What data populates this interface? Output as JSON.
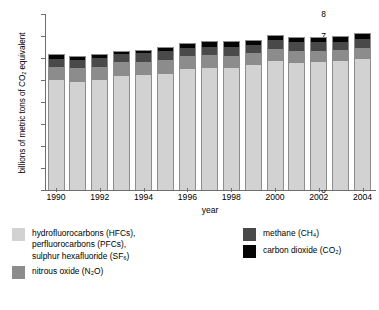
{
  "chart_data": {
    "type": "bar",
    "subtype": "stacked-bar",
    "title": "",
    "xlabel": "year",
    "ylabel": "billions of metric tons of CO2 equivalent",
    "ylabel_display": "billions of metric tons of CO₂ equivalent",
    "ylim": [
      0,
      8
    ],
    "ytick_values": [
      0,
      1,
      2,
      3,
      4,
      5,
      6,
      7,
      8
    ],
    "ytick_labels": [
      "0",
      "1",
      "2",
      "3",
      "4",
      "5",
      "6",
      "7",
      "8"
    ],
    "grid": false,
    "legend_position": "below-plot",
    "categories": [
      1990,
      1991,
      1992,
      1993,
      1994,
      1995,
      1996,
      1997,
      1998,
      1999,
      2000,
      2001,
      2002,
      2003,
      2004
    ],
    "xtick_labels": [
      "1990",
      "1992",
      "1994",
      "1996",
      "1998",
      "2000",
      "2002",
      "2004"
    ],
    "xtick_categories": [
      1990,
      1992,
      1994,
      1996,
      1998,
      2000,
      2002,
      2004
    ],
    "series": [
      {
        "name": "carbon dioxide (CO2)",
        "color": "#050505",
        "values": [
          5.02,
          4.96,
          5.05,
          5.24,
          5.27,
          5.33,
          5.53,
          5.58,
          5.57,
          5.71,
          5.89,
          5.83,
          5.85,
          5.88,
          5.97
        ]
      },
      {
        "name": "methane (CH4)",
        "color": "#494949",
        "values": [
          0.62,
          0.62,
          0.6,
          0.6,
          0.6,
          0.6,
          0.59,
          0.58,
          0.57,
          0.55,
          0.55,
          0.54,
          0.53,
          0.52,
          0.52
        ]
      },
      {
        "name": "nitrous oxide (N2O)",
        "color": "#8c8c8c",
        "values": [
          0.38,
          0.38,
          0.39,
          0.38,
          0.41,
          0.42,
          0.4,
          0.4,
          0.4,
          0.39,
          0.4,
          0.39,
          0.39,
          0.39,
          0.4
        ]
      },
      {
        "name": "hydrofluorocarbons (HFCs), perfluorocarbons (PFCs), sulphur hexafluoride (SF6)",
        "color": "#d2d2d2",
        "values": [
          0.14,
          0.12,
          0.15,
          0.08,
          0.1,
          0.16,
          0.16,
          0.2,
          0.25,
          0.16,
          0.2,
          0.19,
          0.19,
          0.22,
          0.24
        ]
      }
    ],
    "totals": [
      6.16,
      6.08,
      6.19,
      6.3,
      6.38,
      6.51,
      6.68,
      6.76,
      6.79,
      6.81,
      7.04,
      6.95,
      6.96,
      7.01,
      7.13
    ]
  },
  "axes": {
    "y_title": "billions of metric tons of CO₂ equivalent",
    "x_title": "year",
    "y_ticks": [
      "8",
      "7",
      "6",
      "5",
      "4",
      "3",
      "2",
      "1",
      "0"
    ],
    "x_ticks": [
      "1990",
      "1992",
      "1994",
      "1996",
      "1998",
      "2000",
      "2002",
      "2004"
    ]
  },
  "legend": {
    "left": [
      {
        "swatch": "hfc-pfc-sf6-swatch",
        "color": "#d2d2d2",
        "lines": [
          "hydrofluorocarbons (HFCs),",
          "perfluorocarbons (PFCs),",
          "sulphur hexafluoride (SF₆)"
        ]
      },
      {
        "swatch": "n2o-swatch",
        "color": "#8c8c8c",
        "lines": [
          "nitrous oxide (N₂O)"
        ]
      }
    ],
    "right": [
      {
        "swatch": "ch4-swatch",
        "color": "#494949",
        "lines": [
          "methane (CH₄)"
        ]
      },
      {
        "swatch": "co2-swatch",
        "color": "#050505",
        "lines": [
          "carbon dioxide (CO₂)"
        ]
      }
    ]
  },
  "colors": {
    "hfc_pfc_sf6": "#d2d2d2",
    "n2o": "#8c8c8c",
    "ch4": "#494949",
    "co2": "#050505",
    "axis": "#6e6e6e",
    "bar_border": "#8d8d8d",
    "background": "#ffffff"
  }
}
